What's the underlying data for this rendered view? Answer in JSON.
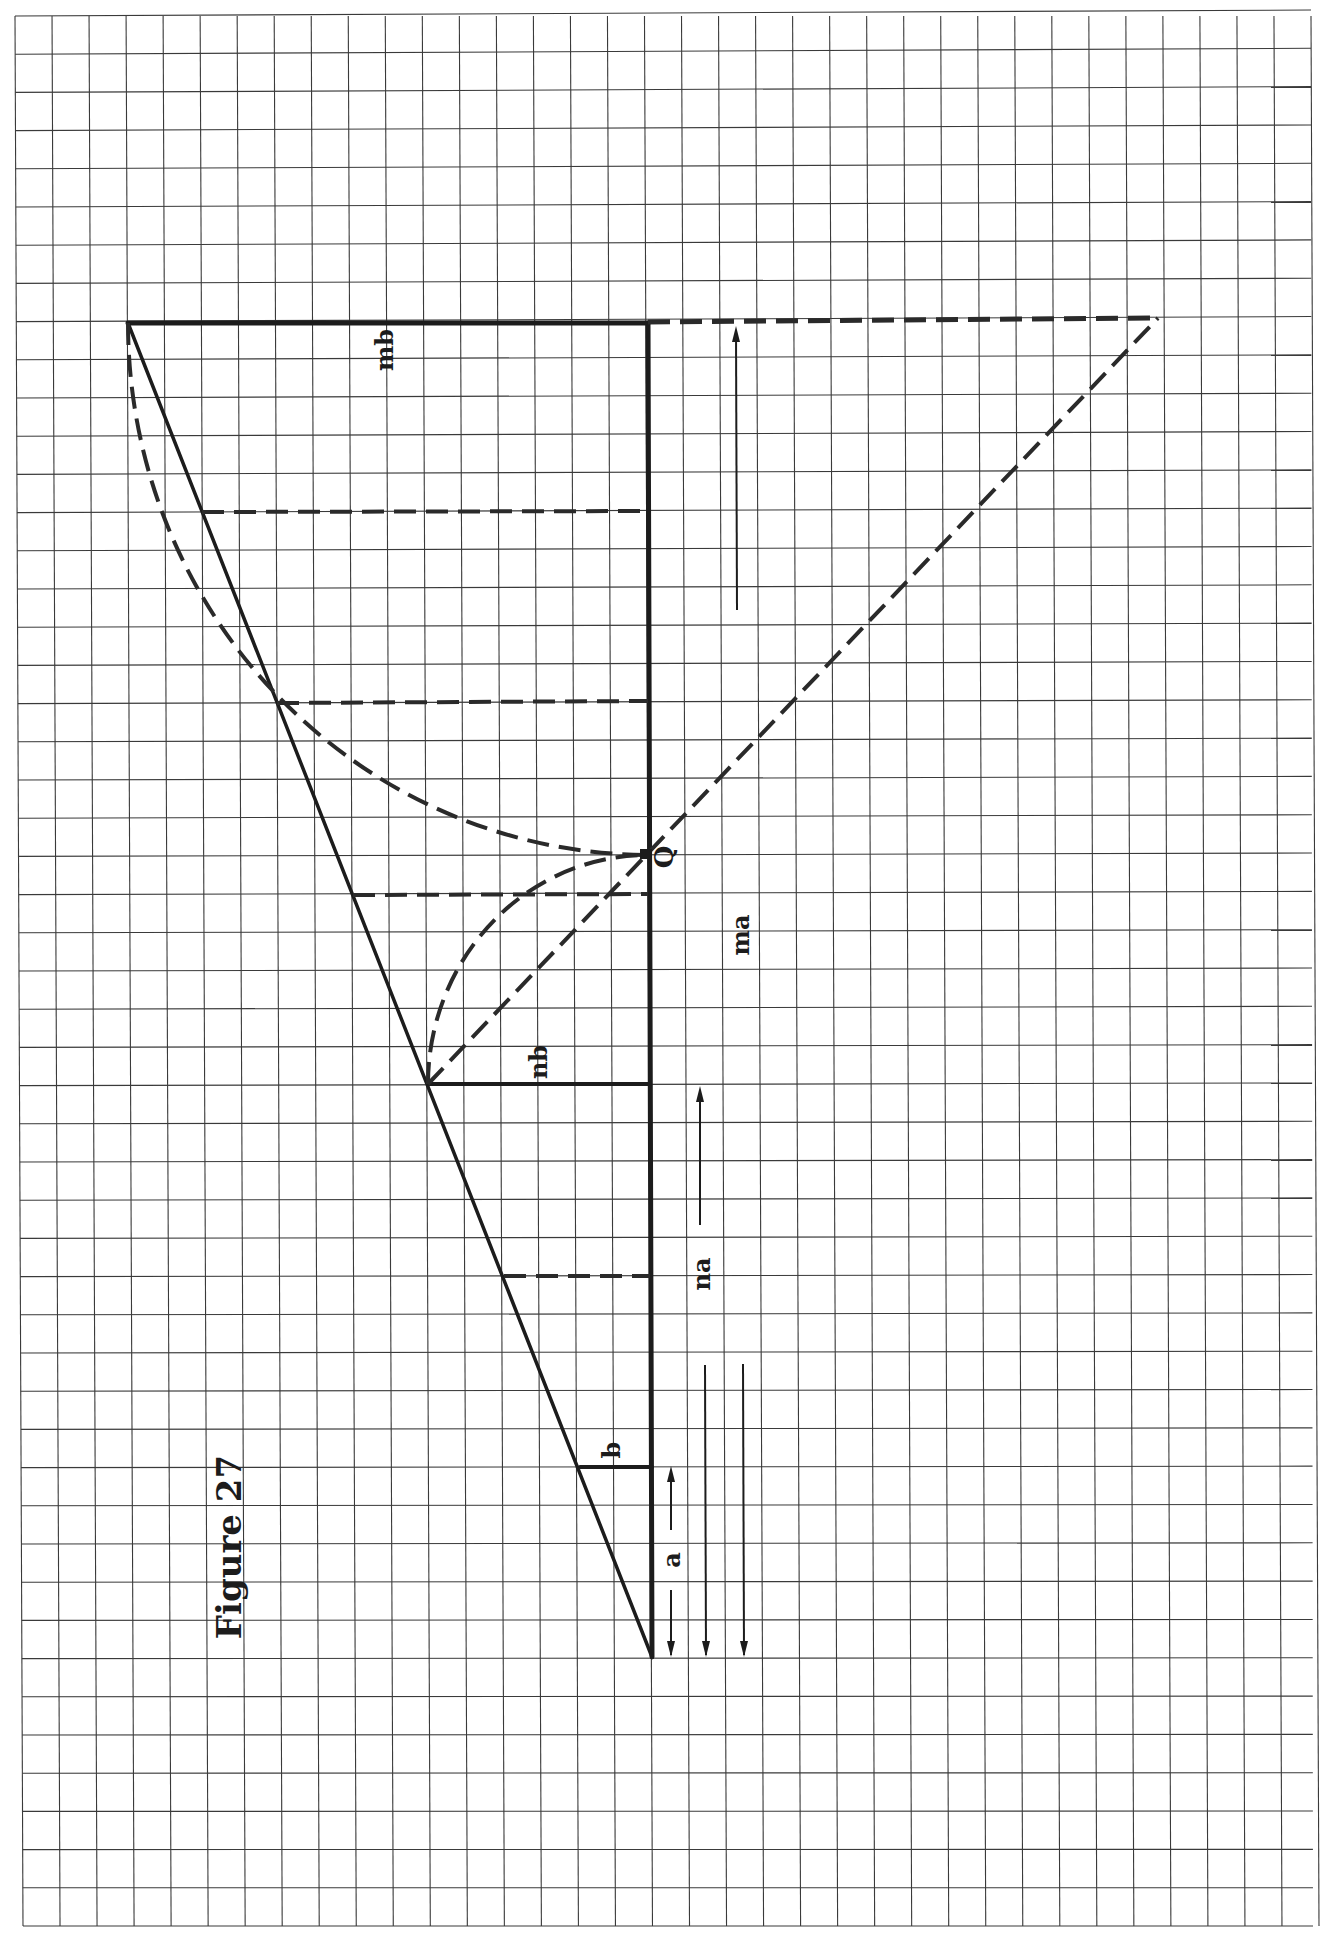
{
  "figure": {
    "title": "Figure 27",
    "rotation_deg": -90
  },
  "grid": {
    "x0": 15,
    "y0": 16,
    "x1": 1311,
    "y1": 1926,
    "cols": 35,
    "rows": 50,
    "line_color": "#3a3a3a"
  },
  "labels": {
    "mb": "mb",
    "nb": "nb",
    "b": "b",
    "a": "a",
    "na": "na",
    "ma": "ma",
    "q": "Q"
  },
  "points": {
    "apex": [
      128,
      323
    ],
    "top_baseline": [
      648,
      323
    ],
    "top_right": [
      1158,
      318
    ],
    "q": [
      648,
      855
    ],
    "nb_point": [
      428,
      1084
    ],
    "nb_base": [
      650,
      1084
    ],
    "b_point": [
      580,
      1467
    ],
    "b_base": [
      652,
      1467
    ],
    "origin": [
      652,
      1657
    ]
  },
  "colors": {
    "ink": "#1c1c1c",
    "paper": "#ffffff"
  }
}
